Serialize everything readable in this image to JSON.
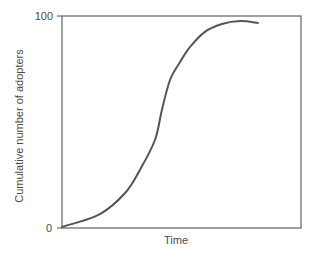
{
  "chart_data": {
    "type": "line",
    "title": "",
    "xlabel": "Time",
    "ylabel": "Cumulative number of adopters",
    "xlim": [
      0,
      100
    ],
    "ylim": [
      0,
      100
    ],
    "yticks": [
      0,
      100
    ],
    "ytick_labels": [
      "0",
      "100"
    ],
    "xticks": [],
    "grid": false,
    "legend": null,
    "frame": "box",
    "series": [
      {
        "name": "Cumulative adopters (S-curve)",
        "color": "#555555",
        "x": [
          0,
          15.9,
          26.4,
          32.6,
          38.9,
          41.8,
          45.2,
          49.4,
          53.6,
          59.8,
          66.9,
          74.5,
          82.0
        ],
        "y": [
          0.5,
          6.6,
          16.5,
          27.4,
          41.5,
          55.7,
          69.8,
          78.3,
          85.4,
          92.5,
          96.2,
          97.6,
          96.7
        ]
      }
    ]
  },
  "colors": {
    "axis": "#6e6e6e",
    "curve": "#555555",
    "text": "#4a4a4a"
  }
}
